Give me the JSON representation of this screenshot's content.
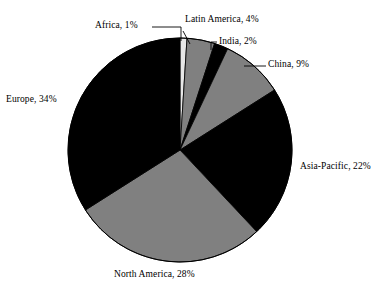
{
  "chart_data": {
    "type": "pie",
    "title": "",
    "categories": [
      "Africa",
      "Latin America",
      "India",
      "China",
      "Asia-Pacific",
      "North America",
      "Europe"
    ],
    "values": [
      1,
      4,
      2,
      9,
      22,
      28,
      34
    ],
    "unit": "%",
    "start_angle_deg": 0,
    "direction": "clockwise",
    "legend": "none",
    "labels_position": "outside-with-leader-lines",
    "grid": false,
    "slices": [
      {
        "name": "Africa",
        "value": 1,
        "label": "Africa, 1%",
        "color": "#e8e8e8",
        "has_leader_line": true
      },
      {
        "name": "Latin America",
        "value": 4,
        "label": "Latin America, 4%",
        "color": "#808080",
        "has_leader_line": true
      },
      {
        "name": "India",
        "value": 2,
        "label": "India, 2%",
        "color": "#000000",
        "has_leader_line": true
      },
      {
        "name": "China",
        "value": 9,
        "label": "China, 9%",
        "color": "#808080",
        "has_leader_line": true
      },
      {
        "name": "Asia-Pacific",
        "value": 22,
        "label": "Asia-Pacific, 22%",
        "color": "#000000",
        "has_leader_line": false
      },
      {
        "name": "North America",
        "value": 28,
        "label": "North America, 28%",
        "color": "#808080",
        "has_leader_line": false
      },
      {
        "name": "Europe",
        "value": 34,
        "label": "Europe, 34%",
        "color": "#000000",
        "has_leader_line": false
      }
    ],
    "colors": {
      "background": "#ffffff",
      "outline": "#000000",
      "text": "#000000",
      "light_gray": "#e8e8e8",
      "mid_gray": "#808080",
      "black": "#000000"
    }
  }
}
